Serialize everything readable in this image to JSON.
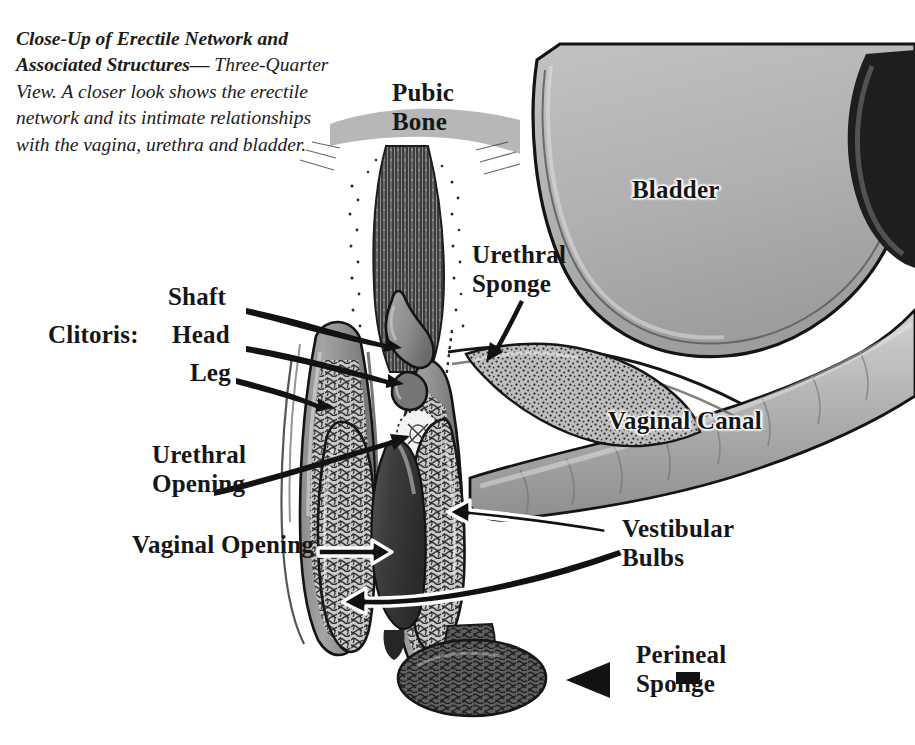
{
  "figure": {
    "caption_bold": "Close-Up of Erectile Network and Associated Structures—",
    "caption_rest": "Three-Quarter View. A closer look shows the erectile network and its intimate relationships with the vagina, urethra and bladder.",
    "background_color": "#ffffff",
    "ink_color": "#161616",
    "tissue_gray": "#9a9a9a",
    "bladder_gray": "#b4b4b4",
    "dark_tissue": "#3a3a3a"
  },
  "labels": {
    "pubic_bone": "Pubic\nBone",
    "bladder": "Bladder",
    "urethral_sponge": "Urethral\nSponge",
    "vaginal_canal": "Vaginal Canal",
    "clitoris_group": "Clitoris:",
    "clitoris_shaft": "Shaft",
    "clitoris_head": "Head",
    "clitoris_leg": "Leg",
    "urethral_opening": "Urethral\nOpening",
    "vaginal_opening": "Vaginal Opening",
    "vestibular_bulbs": "Vestibular\nBulbs",
    "perineal_sponge": "Perineal\nSponge"
  }
}
